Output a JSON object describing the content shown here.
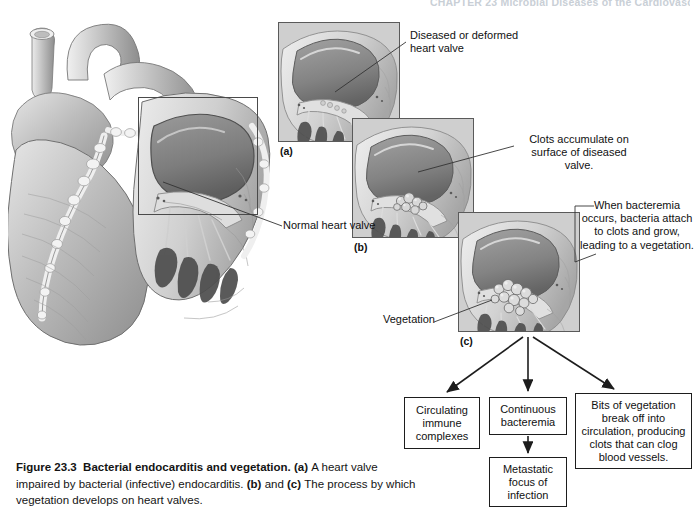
{
  "running_head": "CHAPTER 23   Microbial Diseases of the Cardiovascular",
  "figure": {
    "number": "Figure 23.3",
    "title": "Bacterial endocarditis and vegetation.",
    "caption_parts": {
      "a_marker": "(a)",
      "a_text": "A heart valve impaired by bacterial (infective) endocarditis.",
      "b_marker": "(b)",
      "and_word": "and",
      "c_marker": "(c)",
      "c_text": "The process by which vegetation develops on heart valves."
    }
  },
  "panels": [
    {
      "id": "a",
      "label": "(a)",
      "alt": "heart-valve-closeup-normal"
    },
    {
      "id": "b",
      "label": "(b)",
      "alt": "heart-valve-with-clots"
    },
    {
      "id": "c",
      "label": "(c)",
      "alt": "heart-valve-with-vegetation"
    }
  ],
  "callouts": {
    "diseased_valve": "Diseased or deformed heart valve",
    "clots": "Clots accumulate on surface of diseased valve.",
    "bacteremia": "When bacteremia occurs, bacteria attach to clots and grow, leading to a vegetation.",
    "normal_valve": "Normal heart valve",
    "vegetation": "Vegetation"
  },
  "flowchart": {
    "boxes": [
      {
        "id": "immune",
        "text": "Circulating immune complexes"
      },
      {
        "id": "continuous",
        "text": "Continuous bacteremia"
      },
      {
        "id": "metastatic",
        "text": "Metastatic focus of infection"
      },
      {
        "id": "bits",
        "text": "Bits of vegetation break off into circulation, producing clots that can clog blood vessels."
      }
    ]
  },
  "colors": {
    "ink": "#111111",
    "line": "#1d1d1d",
    "illustration_mid": "#b4b4b4",
    "illustration_dark": "#6d6d6d",
    "illustration_light": "#e2e2e2",
    "page_background": "#ffffff"
  }
}
